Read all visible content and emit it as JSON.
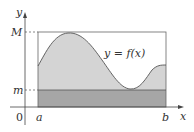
{
  "diagram": {
    "title": "",
    "curve_label": "y = f(x)",
    "axis_labels": {
      "x": "x",
      "y": "y"
    },
    "origin_label": "0",
    "x_ticks": {
      "a": "a",
      "b": "b"
    },
    "y_ticks": {
      "M": "M",
      "m": "m"
    },
    "colors": {
      "upper_region": "#d4d4d4",
      "lower_rect": "#a6a6a6",
      "lines": "#555555",
      "axis": "#444444",
      "text": "#333333"
    }
  }
}
